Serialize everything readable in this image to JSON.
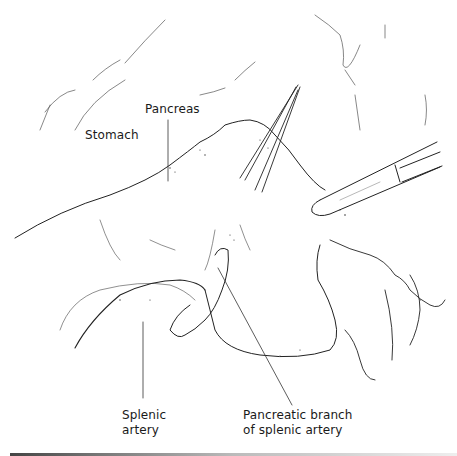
{
  "figure": {
    "type": "surgical-illustration",
    "labels": {
      "stomach": "Stomach",
      "pancreas": "Pancreas",
      "splenic_artery_line1": "Splenic",
      "splenic_artery_line2": "artery",
      "pancreatic_branch_line1": "Pancreatic branch",
      "pancreatic_branch_line2": "of splenic artery"
    },
    "instruments": [
      "forceps",
      "suction-tube"
    ],
    "colors": {
      "ink": "#1a1a1a",
      "background": "#ffffff"
    }
  }
}
